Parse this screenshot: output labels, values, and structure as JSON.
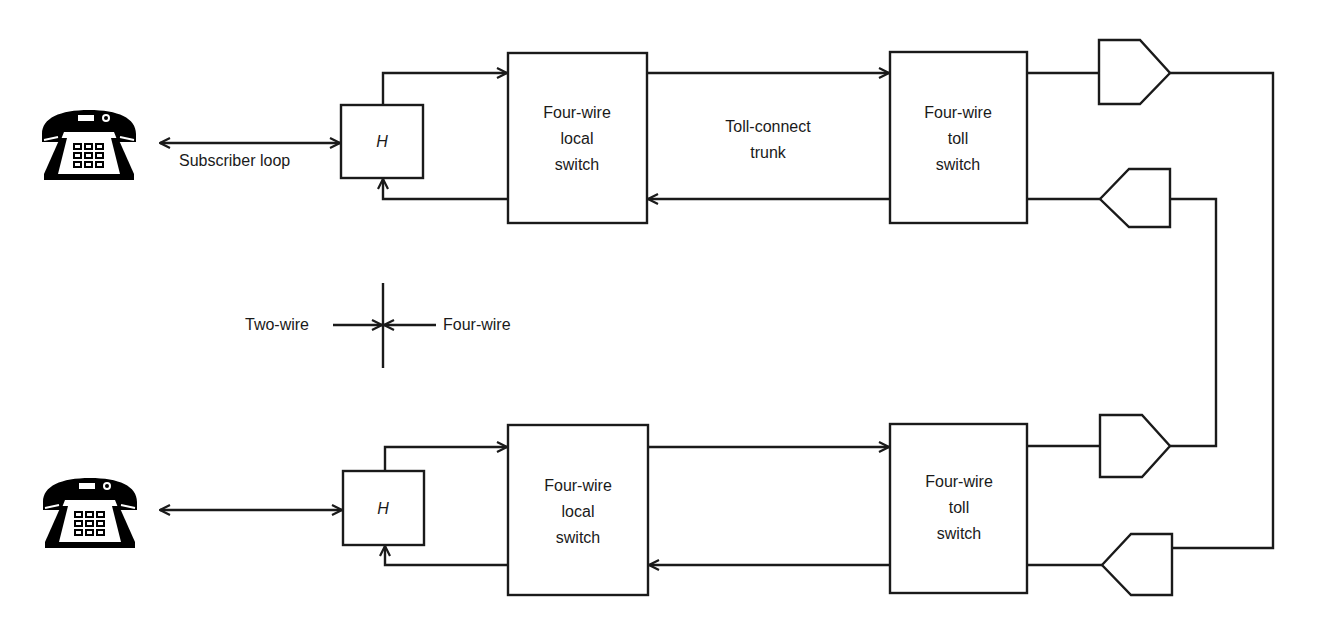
{
  "diagram": {
    "type": "block-diagram",
    "colors": {
      "stroke": "#1a1a1a",
      "fill": "#000000",
      "background": "#ffffff"
    },
    "top_path": {
      "telephone_icon": "telephone-icon",
      "subscriber_loop_label": "Subscriber loop",
      "hybrid_label": "H",
      "local_switch_label": "Four-wire\nlocal\nswitch",
      "trunk_label": "Toll-connect\ntrunk",
      "toll_switch_label": "Four-wire\ntoll\nswitch"
    },
    "bottom_path": {
      "telephone_icon": "telephone-icon",
      "hybrid_label": "H",
      "local_switch_label": "Four-wire\nlocal\nswitch",
      "toll_switch_label": "Four-wire\ntoll\nswitch"
    },
    "legend": {
      "left_label": "Two-wire",
      "right_label": "Four-wire"
    },
    "amplifiers": [
      {
        "id": "amp-top-east",
        "direction": "right"
      },
      {
        "id": "amp-top-west",
        "direction": "left"
      },
      {
        "id": "amp-bottom-east",
        "direction": "right"
      },
      {
        "id": "amp-bottom-west",
        "direction": "left"
      }
    ]
  }
}
